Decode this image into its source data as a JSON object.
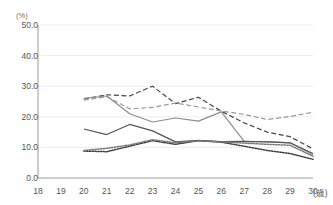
{
  "chart_title": "",
  "axes": {
    "y_unit_label": "(%)",
    "x_unit_label": "(歳)",
    "y_ticks": [
      "0.0",
      "10.0",
      "20.0",
      "30.0",
      "40.0",
      "50.0"
    ],
    "x_ticks": [
      "18",
      "19",
      "20",
      "21",
      "22",
      "23",
      "24",
      "25",
      "26",
      "27",
      "28",
      "29",
      "30"
    ]
  },
  "colors": {
    "grid": "#e8e8e8",
    "axis": "#9a9a9a",
    "tick_text": "#555555",
    "series_dark": "#444444",
    "series_gray": "#8d8d8d",
    "series_mid": "#6f6f6f"
  },
  "chart_data": {
    "type": "line",
    "title": "",
    "xlabel": "(歳)",
    "ylabel": "(%)",
    "xlim": [
      18,
      30
    ],
    "ylim": [
      0.0,
      50.0
    ],
    "grid": true,
    "legend": "none",
    "x": [
      20,
      21,
      22,
      23,
      24,
      25,
      26,
      27,
      28,
      29,
      30
    ],
    "series": [
      {
        "name": "series-1",
        "style": "dashed",
        "color": "#444444",
        "values": [
          25.8,
          27.2,
          26.8,
          30.0,
          24.3,
          26.4,
          21.8,
          18.0,
          15.0,
          13.5,
          9.5
        ]
      },
      {
        "name": "series-2",
        "style": "dashed",
        "color": "#9a9a9a",
        "values": [
          25.4,
          26.6,
          22.6,
          23.1,
          24.5,
          23.2,
          21.9,
          20.8,
          19.1,
          20.1,
          21.5
        ]
      },
      {
        "name": "series-3",
        "style": "solid",
        "color": "#8d8d8d",
        "values": [
          26.0,
          26.8,
          21.0,
          18.3,
          19.6,
          18.6,
          21.6,
          12.0,
          11.9,
          11.5,
          7.6
        ]
      },
      {
        "name": "series-4",
        "style": "solid",
        "color": "#555555",
        "values": [
          16.0,
          14.2,
          17.5,
          15.4,
          11.8,
          12.3,
          11.9,
          12.0,
          11.8,
          11.5,
          8.0
        ]
      },
      {
        "name": "series-5",
        "style": "dotted",
        "color": "#3d3d3d",
        "values": [
          8.8,
          8.6,
          10.4,
          12.2,
          11.0,
          12.2,
          11.7,
          10.4,
          9.0,
          8.0,
          6.1
        ]
      },
      {
        "name": "series-6",
        "style": "dotted",
        "color": "#7a7a7a",
        "values": [
          9.0,
          9.7,
          10.8,
          12.5,
          11.5,
          12.2,
          11.8,
          11.4,
          11.0,
          10.7,
          7.1
        ]
      }
    ]
  }
}
